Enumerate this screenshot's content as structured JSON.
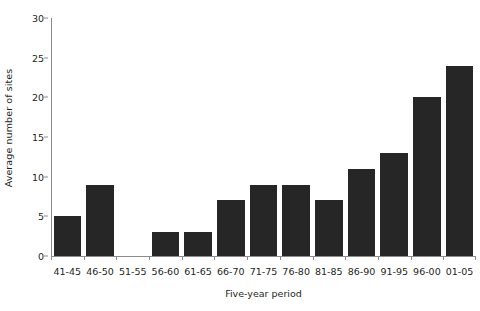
{
  "chart_data": {
    "type": "bar",
    "title": "",
    "xlabel": "Five-year period",
    "ylabel": "Average number of sites",
    "categories": [
      "41-45",
      "46-50",
      "51-55",
      "56-60",
      "61-65",
      "66-70",
      "71-75",
      "76-80",
      "81-85",
      "86-90",
      "91-95",
      "96-00",
      "01-05"
    ],
    "values": [
      5,
      9,
      0,
      3,
      3,
      7,
      9,
      9,
      7,
      11,
      13,
      20,
      24
    ],
    "ylim": [
      0,
      30
    ],
    "yticks": [
      0,
      5,
      10,
      15,
      20,
      25,
      30
    ],
    "ytick_labels": [
      "0",
      "5",
      "10",
      "15",
      "20",
      "25",
      "30"
    ],
    "grid": false,
    "legend": null,
    "bar_color": "#262626",
    "axis_color": "#8b8b8b",
    "text_color": "#231f20",
    "background": "#ffffff"
  }
}
